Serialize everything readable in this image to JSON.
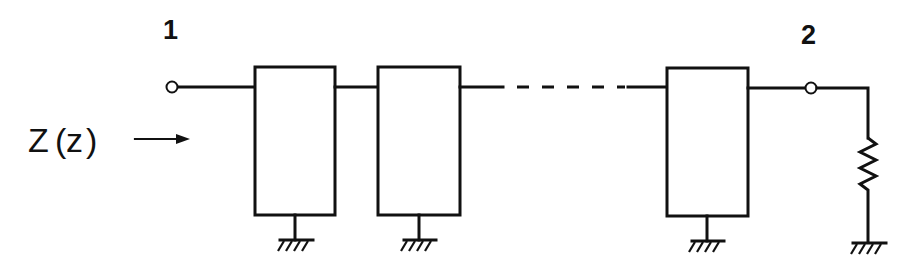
{
  "diagram": {
    "type": "cascaded two-port network terminated in load",
    "labels": {
      "port1": "1",
      "port2": "2",
      "impedance_symbol": "Z",
      "impedance_open_paren": "(",
      "impedance_arg": "z",
      "impedance_close_paren": ")"
    },
    "components": [
      {
        "id": "terminal-1",
        "kind": "terminal"
      },
      {
        "id": "two-port-1",
        "kind": "two-port block",
        "grounded": true
      },
      {
        "id": "two-port-2",
        "kind": "two-port block",
        "grounded": true
      },
      {
        "id": "ellipsis",
        "kind": "dashed connection (repeated sections)"
      },
      {
        "id": "two-port-n",
        "kind": "two-port block",
        "grounded": true
      },
      {
        "id": "terminal-2",
        "kind": "terminal"
      },
      {
        "id": "load",
        "kind": "resistor",
        "grounded": true
      }
    ],
    "colors": {
      "ink": "#111111",
      "background": "#ffffff"
    }
  }
}
